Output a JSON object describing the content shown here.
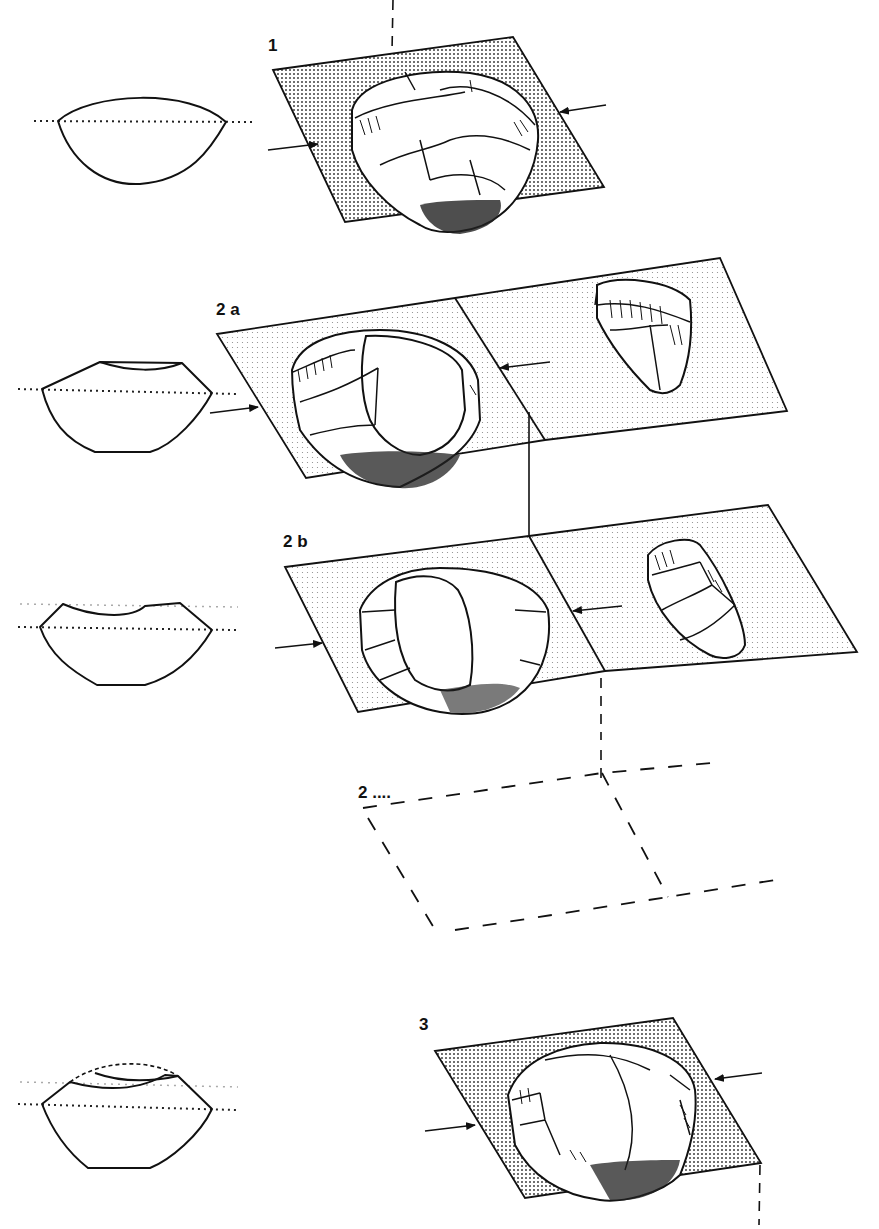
{
  "figure": {
    "type": "technical-illustration",
    "colors": {
      "ink": "#111111",
      "background": "#ffffff",
      "stipple": "#333333"
    }
  },
  "stages": [
    {
      "id": "1",
      "label": "1",
      "plane_fill": "dense-stipple",
      "has_profile": true,
      "has_flake": false,
      "arrows": 2
    },
    {
      "id": "2a",
      "label": "2 a",
      "plane_fill": "light-stipple",
      "has_profile": true,
      "has_flake": true,
      "arrows": 2
    },
    {
      "id": "2b",
      "label": "2 b",
      "plane_fill": "light-stipple",
      "has_profile": true,
      "has_flake": true,
      "arrows": 2
    },
    {
      "id": "2n",
      "label": "2 ....",
      "plane_fill": "none-dashed",
      "has_profile": false,
      "has_flake": false,
      "arrows": 0
    },
    {
      "id": "3",
      "label": "3",
      "plane_fill": "dense-stipple",
      "has_profile": true,
      "has_flake": false,
      "arrows": 2
    }
  ]
}
